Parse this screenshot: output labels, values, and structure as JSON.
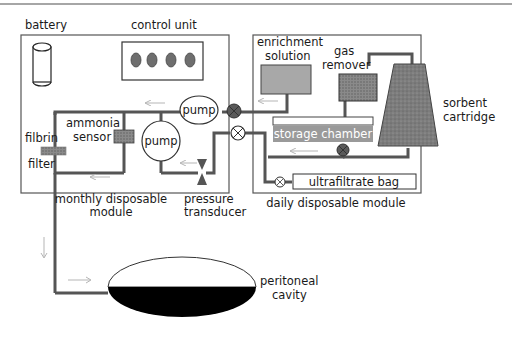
{
  "diagram": {
    "modules": {
      "monthly": {
        "label_line1": "monthly disposable",
        "label_line2": "module"
      },
      "daily": {
        "label": "daily disposable module"
      }
    },
    "components": {
      "battery": "battery",
      "control_unit": "control unit",
      "pump_top": "pump",
      "pump_middle": "pump",
      "ammonia_sensor_line1": "ammonia",
      "ammonia_sensor_line2": "sensor",
      "filbrin_filter_line1": "filbrin",
      "filbrin_filter_line2": "filter",
      "pressure_transducer_line1": "pressure",
      "pressure_transducer_line2": "transducer",
      "enrichment_solution_line1": "enrichment",
      "enrichment_solution_line2": "solution",
      "gas_remover_line1": "gas",
      "gas_remover_line2": "remover",
      "storage_chamber": "storage chamber",
      "sorbent_cartridge_line1": "sorbent",
      "sorbent_cartridge_line2": "cartridge",
      "ultrafiltrate_bag": "ultrafiltrate bag",
      "peritoneal_cavity_line1": "peritoneal",
      "peritoneal_cavity_line2": "cavity"
    },
    "control_unit_indicator_count": 4,
    "colors": {
      "pipe": "#555555",
      "box_fill": "#a8a8a8",
      "storage_fill": "#9a9a9a",
      "cartridge_fill": "#7a7a7a",
      "valve_dark": "#5a5a5a",
      "indicator": "#6e6e6e",
      "flow_arrow": "#b5b5b5"
    }
  }
}
